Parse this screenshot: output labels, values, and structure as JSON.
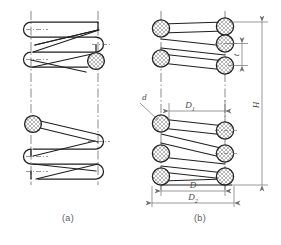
{
  "figure": {
    "colors": {
      "outline": "#1f1f1f",
      "centerline": "#4a4a4a",
      "dimension": "#6e6e6e",
      "hatch": "#8a8a8a",
      "label": "#4a4a4a",
      "background": "#ffffff"
    },
    "views": [
      {
        "id": "a",
        "caption": "(a)",
        "type": "pictorial-helix-view"
      },
      {
        "id": "b",
        "caption": "(b)",
        "type": "sectioned-dimensioned-view"
      }
    ],
    "dimensions": [
      {
        "symbol": "d",
        "name": "wire-diameter",
        "orientation": "leader"
      },
      {
        "symbol": "D₁",
        "name": "inside-diameter",
        "orientation": "horizontal"
      },
      {
        "symbol": "D",
        "name": "mean-coil-diameter",
        "orientation": "horizontal"
      },
      {
        "symbol": "D₂",
        "name": "outside-diameter",
        "orientation": "horizontal"
      },
      {
        "symbol": "t",
        "name": "pitch",
        "orientation": "vertical"
      },
      {
        "symbol": "H",
        "name": "free-height",
        "orientation": "vertical"
      }
    ],
    "labels": {
      "d": "d",
      "D1": "D",
      "D1sub": "1",
      "D": "D",
      "D2": "D",
      "D2sub": "2",
      "t": "t",
      "H": "H",
      "caption_a": "(a)",
      "caption_b": "(b)"
    }
  }
}
